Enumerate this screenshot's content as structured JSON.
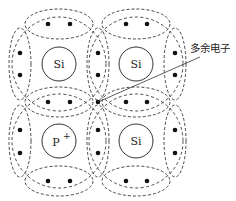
{
  "diagram": {
    "atoms": [
      {
        "label": "Si",
        "cx": 59,
        "cy": 64
      },
      {
        "label": "Si",
        "cx": 136,
        "cy": 64
      },
      {
        "label": "P",
        "superscript": "+",
        "cx": 59,
        "cy": 141
      },
      {
        "label": "Si",
        "cx": 136,
        "cy": 141
      }
    ],
    "annotation": {
      "text": "多余电子",
      "meaning": "extra electron"
    }
  }
}
